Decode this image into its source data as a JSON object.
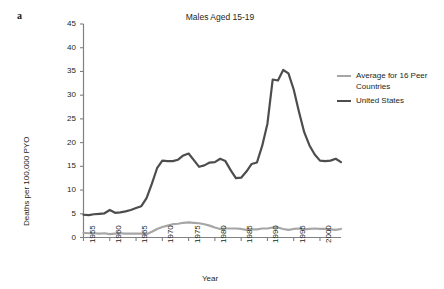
{
  "panel": {
    "label": "a"
  },
  "axis_titles": {
    "x": "Year",
    "y": "Deaths per 100,000 PYO"
  },
  "legend": {
    "items": [
      {
        "label": "Average for 16 Peer Countries",
        "color": "#a6a6a6",
        "key": "peer"
      },
      {
        "label": "United States",
        "color": "#4d4d4d",
        "key": "us"
      }
    ]
  },
  "chart_data": {
    "type": "line",
    "title": "Males Aged 15-19",
    "xlabel": "Year",
    "ylabel": "Deaths per 100,000 PYO",
    "xlim": [
      1955,
      2004
    ],
    "ylim": [
      0,
      45
    ],
    "yticks": [
      0,
      5,
      10,
      15,
      20,
      25,
      30,
      35,
      40,
      45
    ],
    "ytick_labels": [
      "0",
      "5",
      "10",
      "15",
      "20",
      "25",
      "30",
      "35",
      "40",
      "45"
    ],
    "xticks": [
      1955,
      1960,
      1965,
      1970,
      1975,
      1980,
      1985,
      1990,
      1995,
      2000
    ],
    "xtick_labels": [
      "1955",
      "1960",
      "1965",
      "1970",
      "1975",
      "1980",
      "1985",
      "1990",
      "1995",
      "2000"
    ],
    "grid": false,
    "legend_position": "right",
    "x": [
      1955,
      1956,
      1957,
      1958,
      1959,
      1960,
      1961,
      1962,
      1963,
      1964,
      1965,
      1966,
      1967,
      1968,
      1969,
      1970,
      1971,
      1972,
      1973,
      1974,
      1975,
      1976,
      1977,
      1978,
      1979,
      1980,
      1981,
      1982,
      1983,
      1984,
      1985,
      1986,
      1987,
      1988,
      1989,
      1990,
      1991,
      1992,
      1993,
      1994,
      1995,
      1996,
      1997,
      1998,
      1999,
      2000,
      2001,
      2002,
      2003,
      2004
    ],
    "series": [
      {
        "name": "United States",
        "color": "#4d4d4d",
        "values": [
          4.8,
          4.7,
          4.9,
          5.0,
          5.1,
          5.8,
          5.2,
          5.3,
          5.5,
          5.8,
          6.2,
          6.6,
          8.3,
          11.3,
          14.6,
          16.2,
          16.1,
          16.1,
          16.4,
          17.3,
          17.7,
          16.3,
          14.9,
          15.2,
          15.8,
          15.9,
          16.6,
          16.1,
          14.2,
          12.5,
          12.6,
          13.9,
          15.5,
          15.8,
          19.3,
          24.0,
          33.3,
          33.1,
          35.3,
          34.6,
          31.2,
          26.5,
          22.2,
          19.4,
          17.5,
          16.2,
          16.1,
          16.2,
          16.6,
          15.9
        ]
      },
      {
        "name": "Average for 16 Peer Countries",
        "color": "#a6a6a6",
        "values": [
          1.0,
          0.9,
          0.9,
          0.8,
          0.9,
          0.7,
          0.8,
          0.9,
          0.8,
          0.8,
          0.8,
          0.8,
          0.7,
          1.2,
          1.8,
          2.2,
          2.5,
          2.8,
          2.9,
          3.1,
          3.2,
          3.1,
          3.0,
          2.8,
          2.5,
          2.1,
          1.8,
          1.9,
          1.9,
          1.9,
          1.8,
          1.6,
          1.7,
          1.7,
          1.9,
          1.9,
          2.1,
          2.1,
          1.8,
          1.6,
          1.8,
          1.9,
          1.7,
          1.8,
          1.9,
          1.8,
          1.8,
          1.7,
          1.6,
          1.8
        ]
      }
    ]
  }
}
